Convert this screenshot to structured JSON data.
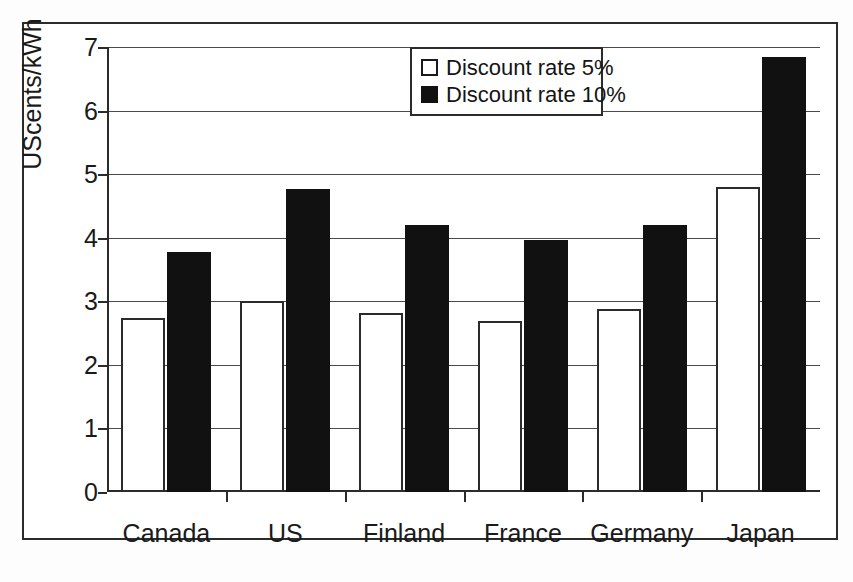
{
  "chart_data": {
    "type": "bar",
    "title": "",
    "subtitle": "",
    "xlabel": "",
    "ylabel": "UScents/kWh",
    "categories": [
      "Canada",
      "US",
      "Finland",
      "France",
      "Germany",
      "Japan"
    ],
    "series": [
      {
        "name": "Discount rate 5%",
        "swatch": "white-square",
        "color": "#ffffff",
        "values": [
          2.73,
          3.0,
          2.82,
          2.69,
          2.88,
          4.8
        ]
      },
      {
        "name": "Discount rate 10%",
        "swatch": "black-square",
        "color": "#111111",
        "values": [
          3.77,
          4.77,
          4.2,
          3.97,
          4.2,
          6.85
        ]
      }
    ],
    "ylim": [
      0,
      7
    ],
    "ytick_labels": [
      "0",
      "1",
      "2",
      "3",
      "4",
      "5",
      "6",
      "7"
    ],
    "ytick_values": [
      0,
      1,
      2,
      3,
      4,
      5,
      6,
      7
    ],
    "grid": "horizontal",
    "legend_position": "top-center",
    "frame": "outer-rectangle-border"
  },
  "legend": {
    "items": [
      {
        "label": "Discount rate 5%",
        "swatch": "white-square"
      },
      {
        "label": "Discount rate 10%",
        "swatch": "black-square"
      }
    ]
  }
}
